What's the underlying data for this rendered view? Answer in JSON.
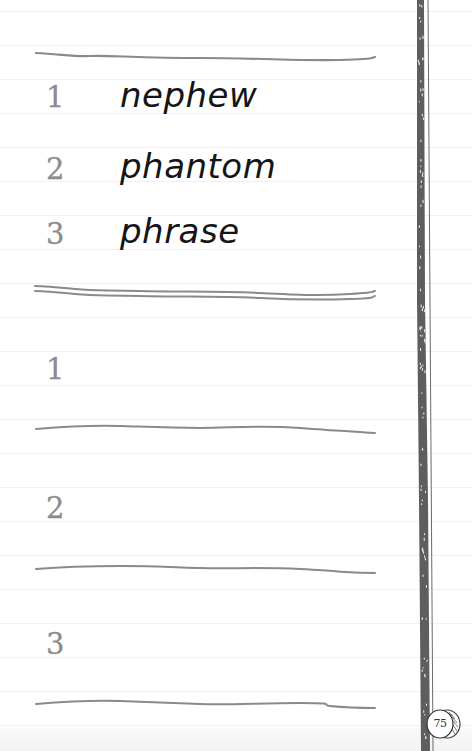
{
  "section_a": {
    "items": [
      {
        "number": "1",
        "word": "nephew"
      },
      {
        "number": "2",
        "word": "phantom"
      },
      {
        "number": "3",
        "word": "phrase"
      }
    ]
  },
  "section_b": {
    "items": [
      {
        "number": "1",
        "answer": ""
      },
      {
        "number": "2",
        "answer": ""
      },
      {
        "number": "3",
        "answer": ""
      }
    ]
  },
  "page_number": "75",
  "colors": {
    "ink": "#151515",
    "numeral": "#8c8c8c",
    "rule": "#8a8a8a",
    "spine": "#5e5e5e"
  }
}
